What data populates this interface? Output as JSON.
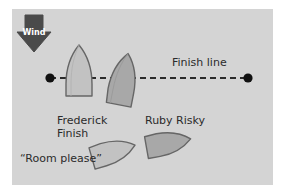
{
  "diagram": {
    "background_color": "#ffffff",
    "panel_color": "#d4d4d4",
    "ink_color": "#2b2b2b",
    "wind": {
      "label": "Wind",
      "arrow_icon": "wind-arrow-down-icon",
      "arrow_color": "#4a4a4a",
      "label_color": "#ffffff",
      "direction": "down"
    },
    "finish_line": {
      "label": "Finish line",
      "style": "dashed",
      "color": "#2b2b2b",
      "left_mark_icon": "finish-mark-dot-icon",
      "right_mark_icon": "finish-mark-dot-icon",
      "mark_color": "#111111",
      "left_mark_x": 50,
      "right_mark_x": 248,
      "line_y": 78
    },
    "boats": [
      {
        "id": "frederick-upper",
        "name": "Frederick Finish",
        "icon": "boat-hull-icon",
        "fill": "#c2c2c2",
        "stroke": "#555555",
        "position": "crossing finish line to windward",
        "heading_deg": 0
      },
      {
        "id": "ruby-upper",
        "name": "Ruby Risky",
        "icon": "boat-hull-icon",
        "fill": "#a8a8a8",
        "stroke": "#555555",
        "position": "crossing finish line to leeward",
        "heading_deg": 12
      },
      {
        "id": "frederick-lower",
        "name": "Frederick Finish",
        "icon": "boat-hull-icon",
        "fill": "#c2c2c2",
        "stroke": "#555555",
        "position": "approaching the line outside",
        "heading_deg": 72
      },
      {
        "id": "ruby-lower",
        "name": "Ruby Risky",
        "icon": "boat-hull-icon",
        "fill": "#a8a8a8",
        "stroke": "#555555",
        "position": "approaching the line inside",
        "heading_deg": 78
      }
    ],
    "labels": {
      "frederick": "Frederick\nFinish",
      "frederick_line1": "Frederick",
      "frederick_line2": "Finish",
      "ruby": "Ruby Risky",
      "hail": "“Room please”"
    }
  }
}
